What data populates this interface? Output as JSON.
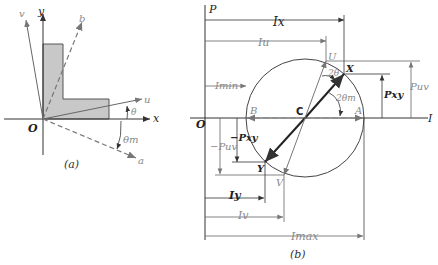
{
  "figure_a": {
    "caption": "(a)",
    "origin": "O",
    "axes": {
      "x": "x",
      "y": "y",
      "u": "u",
      "a": "a",
      "b": "b",
      "v": "v"
    },
    "angles": {
      "theta": "θ",
      "theta_m": "θm"
    },
    "colors": {
      "shape_fill": "#c8c8c8",
      "shape_stroke": "#555555"
    }
  },
  "figure_b": {
    "caption": "(b)",
    "origin": "O",
    "axes": {
      "vertical": "P",
      "horizontal": "I"
    },
    "points": {
      "U": "U",
      "X": "X",
      "B": "B",
      "C": "C",
      "A": "A",
      "Y": "Y",
      "V": "V"
    },
    "dimensions": {
      "Ix": "Ix",
      "Iu": "Iu",
      "Imin": "Imin",
      "Pxy": "Pxy",
      "Puv": "Puv",
      "neg_Pxy": "−Pxy",
      "neg_Puv": "−Puv",
      "Iy": "Iy",
      "Iv": "Iv",
      "Imax": "Imax"
    },
    "angles": {
      "two_theta": "2θ",
      "two_theta_m": "2θm"
    }
  }
}
